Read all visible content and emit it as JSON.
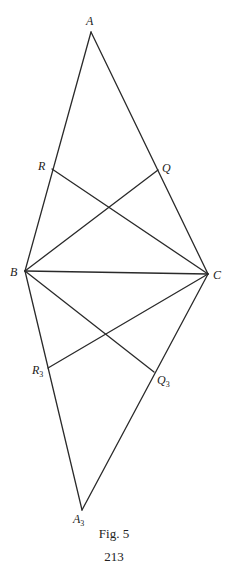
{
  "figure": {
    "caption": "Fig. 5",
    "page_number": "213",
    "stroke_color": "#2a2a2a",
    "points": {
      "A": {
        "label": "A",
        "sub": "",
        "x": 91,
        "y": 32,
        "lx": 86,
        "ly": 25
      },
      "B": {
        "label": "B",
        "sub": "",
        "x": 25,
        "y": 271,
        "lx": 10,
        "ly": 276
      },
      "C": {
        "label": "C",
        "sub": "",
        "x": 208,
        "y": 274,
        "lx": 213,
        "ly": 279
      },
      "R": {
        "label": "R",
        "sub": "",
        "x": 52,
        "y": 169,
        "lx": 38,
        "ly": 170
      },
      "Q": {
        "label": "Q",
        "sub": "",
        "x": 158,
        "y": 170,
        "lx": 162,
        "ly": 172
      },
      "R3": {
        "label": "R",
        "sub": "3",
        "x": 48,
        "y": 368,
        "lx": 32,
        "ly": 374
      },
      "Q3": {
        "label": "Q",
        "sub": "3",
        "x": 154,
        "y": 372,
        "lx": 157,
        "ly": 384
      },
      "A3": {
        "label": "A",
        "sub": "3",
        "x": 82,
        "y": 510,
        "lx": 73,
        "ly": 523
      }
    },
    "segments": [
      [
        "A",
        "B"
      ],
      [
        "A",
        "C"
      ],
      [
        "B",
        "C"
      ],
      [
        "R",
        "C"
      ],
      [
        "B",
        "Q"
      ],
      [
        "B",
        "A3"
      ],
      [
        "C",
        "A3"
      ],
      [
        "B",
        "Q3"
      ],
      [
        "R3",
        "C"
      ]
    ]
  }
}
